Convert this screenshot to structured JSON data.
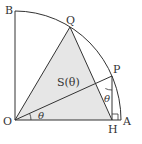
{
  "diagram": {
    "points": {
      "O": {
        "label": "O",
        "x": 15,
        "y": 120
      },
      "A": {
        "label": "A",
        "x": 121,
        "y": 120
      },
      "B": {
        "label": "B",
        "x": 15,
        "y": 11
      },
      "Q": {
        "label": "Q",
        "x": 70,
        "y": 27
      },
      "P": {
        "label": "P",
        "x": 112,
        "y": 76
      },
      "H": {
        "label": "H",
        "x": 112,
        "y": 120
      }
    },
    "area_label": "S(θ)",
    "angle_label_O": "θ",
    "angle_label_P": "θ",
    "colors": {
      "fill": "#e6e6e6",
      "stroke": "#333333",
      "background": "#ffffff"
    }
  }
}
